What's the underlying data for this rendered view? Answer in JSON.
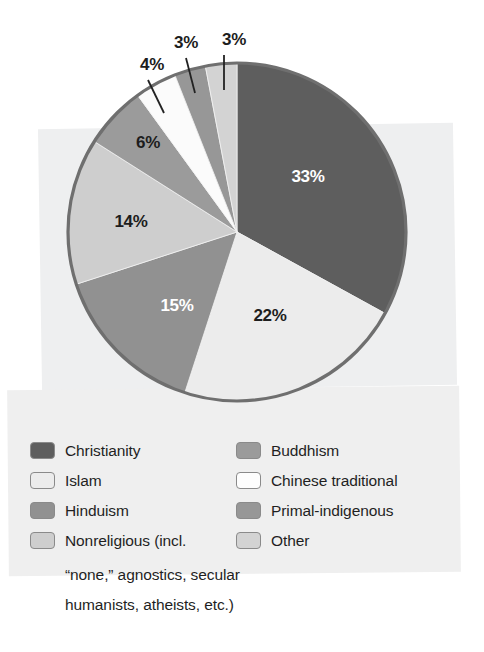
{
  "chart_data": {
    "type": "pie",
    "title": "",
    "subtitle": "",
    "xlabel": "",
    "ylabel": "",
    "legend_position": "bottom",
    "grid": false,
    "unit": "%",
    "categories": [
      "Christianity",
      "Islam",
      "Hinduism",
      "Nonreligious (incl. “none,” agnostics, secular humanists, atheists, etc.)",
      "Buddhism",
      "Chinese traditional",
      "Primal-indigenous",
      "Other"
    ],
    "values": [
      33,
      22,
      15,
      14,
      6,
      4,
      3,
      3
    ],
    "slices": [
      {
        "name": "Christianity",
        "value": 33,
        "label": "33%",
        "color": "#5e5e5e",
        "label_color": "#ffffff",
        "label_inside": true,
        "start_angle": 0,
        "end_angle": 118.8,
        "label_x": 308,
        "label_y": 182
      },
      {
        "name": "Islam",
        "value": 22,
        "label": "22%",
        "color": "#ececec",
        "label_color": "#1d1d1d",
        "label_inside": true,
        "start_angle": 118.8,
        "end_angle": 198.0,
        "label_x": 270,
        "label_y": 321
      },
      {
        "name": "Hinduism",
        "value": 15,
        "label": "15%",
        "color": "#919191",
        "label_color": "#ffffff",
        "label_inside": true,
        "start_angle": 198.0,
        "end_angle": 252.0,
        "label_x": 177,
        "label_y": 311
      },
      {
        "name": "Nonreligious",
        "value": 14,
        "label": "14%",
        "color": "#cecece",
        "label_color": "#1d1d1d",
        "label_inside": true,
        "start_angle": 252.0,
        "end_angle": 302.4,
        "label_x": 131,
        "label_y": 227
      },
      {
        "name": "Buddhism",
        "value": 6,
        "label": "6%",
        "color": "#9b9b9b",
        "label_color": "#1d1d1d",
        "label_inside": true,
        "start_angle": 302.4,
        "end_angle": 324.0,
        "label_x": 148,
        "label_y": 148
      },
      {
        "name": "Chinese traditional",
        "value": 4,
        "label": "4%",
        "color": "#fbfbfb",
        "label_color": "#1d1d1d",
        "label_inside": false,
        "start_angle": 324.0,
        "end_angle": 338.4,
        "label_x": 152,
        "label_y": 70
      },
      {
        "name": "Primal-indigenous",
        "value": 3,
        "label": "3%",
        "color": "#979797",
        "label_color": "#1d1d1d",
        "label_inside": false,
        "start_angle": 338.4,
        "end_angle": 349.2,
        "label_x": 186,
        "label_y": 48
      },
      {
        "name": "Other",
        "value": 3,
        "label": "3%",
        "color": "#d3d3d3",
        "label_color": "#1d1d1d",
        "label_inside": false,
        "start_angle": 349.2,
        "end_angle": 360.0,
        "label_x": 234,
        "label_y": 45
      }
    ],
    "callouts": [
      {
        "label": "4%",
        "x": 152,
        "y": 70,
        "line_x1": 148,
        "line_y1": 80,
        "line_x2": 164,
        "line_y2": 113
      },
      {
        "label": "3%",
        "x": 186,
        "y": 48,
        "line_x1": 186,
        "line_y1": 58,
        "line_x2": 195,
        "line_y2": 93
      },
      {
        "label": "3%",
        "x": 234,
        "y": 45,
        "line_x1": 224,
        "line_y1": 55,
        "line_x2": 224,
        "line_y2": 90
      }
    ],
    "pie_geometry": {
      "center_x": 237,
      "center_y": 232,
      "radius": 169,
      "outline_color": "#6f6f6f"
    }
  },
  "legend": {
    "left_column": [
      {
        "label": "Christianity",
        "color": "#5e5e5e"
      },
      {
        "label": "Islam",
        "color": "#ececec"
      },
      {
        "label": "Hinduism",
        "color": "#919191"
      },
      {
        "label": "Nonreligious (incl.",
        "color": "#cecece"
      }
    ],
    "right_column": [
      {
        "label": "Buddhism",
        "color": "#9b9b9b"
      },
      {
        "label": "Chinese traditional",
        "color": "#fdfdfd"
      },
      {
        "label": "Primal-indigenous",
        "color": "#979797"
      },
      {
        "label": "Other",
        "color": "#d3d3d3"
      }
    ],
    "continuation_lines": [
      "“none,” agnostics, secular",
      "humanists, atheists, etc.)"
    ]
  }
}
